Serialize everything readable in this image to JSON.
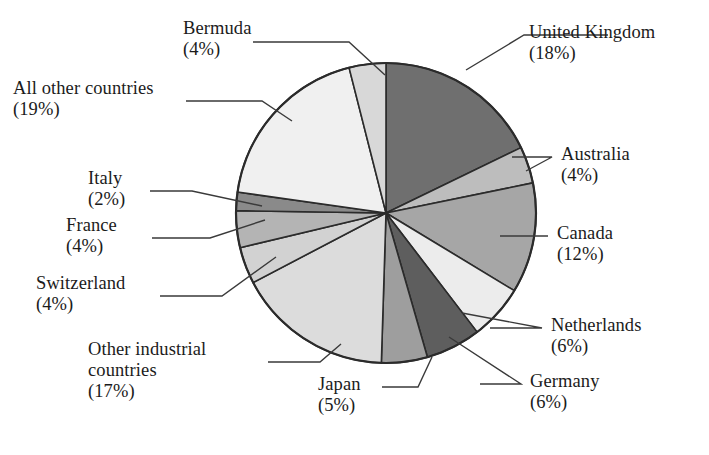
{
  "figure": {
    "title_partial": "",
    "background": "#ffffff",
    "text_color": "#1b1b1b",
    "outline_color": "#2b2b2b"
  },
  "chart_data": {
    "type": "pie",
    "title": "",
    "xlabel": "",
    "ylabel": "",
    "legend_position": "callout-labels",
    "grid": false,
    "start_angle_deg": 0,
    "direction": "clockwise",
    "total": 101,
    "units": "percent",
    "categories": [
      "United Kingdom",
      "Australia",
      "Canada",
      "Netherlands",
      "Germany",
      "Japan",
      "Other industrial countries",
      "Switzerland",
      "France",
      "Italy",
      "All other countries",
      "Bermuda"
    ],
    "values": [
      18,
      4,
      12,
      6,
      6,
      5,
      17,
      4,
      4,
      2,
      19,
      4
    ],
    "slices": [
      {
        "label": "United Kingdom",
        "label_lines": [
          "United Kingdom"
        ],
        "pct": 18,
        "pct_text": "(18%)",
        "color": "#6f6f6f"
      },
      {
        "label": "Australia",
        "label_lines": [
          "Australia"
        ],
        "pct": 4,
        "pct_text": "(4%)",
        "color": "#bdbdbd"
      },
      {
        "label": "Canada",
        "label_lines": [
          "Canada"
        ],
        "pct": 12,
        "pct_text": "(12%)",
        "color": "#a6a6a6"
      },
      {
        "label": "Netherlands",
        "label_lines": [
          "Netherlands"
        ],
        "pct": 6,
        "pct_text": "(6%)",
        "color": "#ececec"
      },
      {
        "label": "Germany",
        "label_lines": [
          "Germany"
        ],
        "pct": 6,
        "pct_text": "(6%)",
        "color": "#5e5e5e"
      },
      {
        "label": "Japan",
        "label_lines": [
          "Japan"
        ],
        "pct": 5,
        "pct_text": "(5%)",
        "color": "#9e9e9e"
      },
      {
        "label": "Other industrial countries",
        "label_lines": [
          "Other industrial",
          "countries"
        ],
        "pct": 17,
        "pct_text": "(17%)",
        "color": "#dcdcdc"
      },
      {
        "label": "Switzerland",
        "label_lines": [
          "Switzerland"
        ],
        "pct": 4,
        "pct_text": "(4%)",
        "color": "#d2d2d2"
      },
      {
        "label": "France",
        "label_lines": [
          "France"
        ],
        "pct": 4,
        "pct_text": "(4%)",
        "color": "#b4b4b4"
      },
      {
        "label": "Italy",
        "label_lines": [
          "Italy"
        ],
        "pct": 2,
        "pct_text": "(2%)",
        "color": "#8a8a8a"
      },
      {
        "label": "All other countries",
        "label_lines": [
          "All other countries"
        ],
        "pct": 19,
        "pct_text": "(19%)",
        "color": "#f0f0f0"
      },
      {
        "label": "Bermuda",
        "label_lines": [
          "Bermuda"
        ],
        "pct": 4,
        "pct_text": "(4%)",
        "color": "#d8d8d8"
      }
    ]
  },
  "callouts": {
    "bermuda": {
      "name": "Bermuda",
      "pct": "(4%)"
    },
    "all_other_countries": {
      "name": "All other countries",
      "pct": "(19%)"
    },
    "italy": {
      "name": "Italy",
      "pct": "(2%)"
    },
    "france": {
      "name": "France",
      "pct": "(4%)"
    },
    "switzerland": {
      "name": "Switzerland",
      "pct": "(4%)"
    },
    "other_industrial": {
      "name_l1": "Other industrial",
      "name_l2": "countries",
      "pct": "(17%)"
    },
    "japan": {
      "name": "Japan",
      "pct": "(5%)"
    },
    "germany": {
      "name": "Germany",
      "pct": "(6%)"
    },
    "netherlands": {
      "name": "Netherlands",
      "pct": "(6%)"
    },
    "canada": {
      "name": "Canada",
      "pct": "(12%)"
    },
    "australia": {
      "name": "Australia",
      "pct": "(4%)"
    },
    "united_kingdom": {
      "name": "United Kingdom",
      "pct": "(18%)"
    }
  }
}
